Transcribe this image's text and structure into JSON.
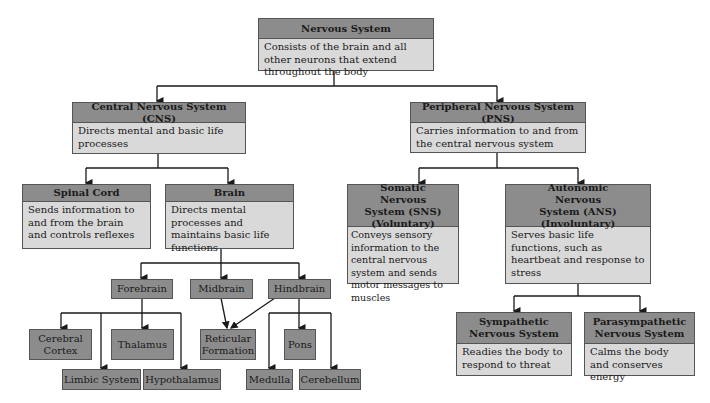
{
  "diagram": {
    "root": {
      "title": "Nervous System",
      "desc": "Consists of the brain and all other neurons that extend throughout the body"
    },
    "cns": {
      "title": "Central Nervous System (CNS)",
      "desc": "Directs mental and basic life processes"
    },
    "pns": {
      "title": "Peripheral Nervous System (PNS)",
      "desc": "Carries information to and from the central nervous system"
    },
    "spinal_cord": {
      "title": "Spinal Cord",
      "desc": "Sends information to and from the brain and controls reflexes"
    },
    "brain": {
      "title": "Brain",
      "desc": "Directs mental processes and maintains basic life functions"
    },
    "sns": {
      "title": "Somatic Nervous System (SNS) (Voluntary)",
      "desc": "Conveys sensory information to the central nervous system and sends motor messages to muscles"
    },
    "ans": {
      "title": "Autonomic Nervous System (ANS) (Involuntary)",
      "desc": "Serves basic life functions, such as heartbeat and response to stress"
    },
    "sympathetic": {
      "title": "Sympathetic Nervous System",
      "desc": "Readies the body to respond to threat"
    },
    "parasympathetic": {
      "title": "Parasympathetic Nervous System",
      "desc": "Calms the body and conserves energy"
    },
    "brain_parts": {
      "forebrain": "Forebrain",
      "midbrain": "Midbrain",
      "hindbrain": "Hindbrain",
      "cerebral_cortex": "Cerebral Cortex",
      "thalamus": "Thalamus",
      "reticular_formation": "Reticular Formation",
      "pons": "Pons",
      "limbic_system": "Limbic System",
      "hypothalamus": "Hypothalamus",
      "medulla": "Medulla",
      "cerebellum": "Cerebellum"
    }
  },
  "colors": {
    "header": "#8c8c8c",
    "body": "#d9d9d9",
    "border": "#555555",
    "line": "#1a1a1a"
  }
}
